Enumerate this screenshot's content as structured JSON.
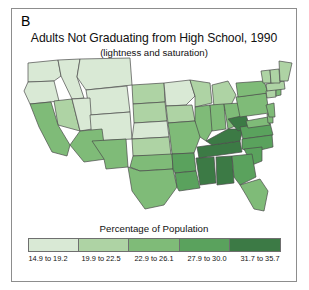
{
  "figure": {
    "panel_letter": "B",
    "title": "Adults Not Graduating from High School, 1990",
    "subtitle": "(lightness and saturation)"
  },
  "legend": {
    "title": "Percentage of Population",
    "classes": [
      {
        "label": "14.9 to 19.2",
        "color": "#d9e9d5",
        "min": 14.9,
        "max": 19.2
      },
      {
        "label": "19.9 to 22.5",
        "color": "#aed3a4",
        "min": 19.9,
        "max": 22.5
      },
      {
        "label": "22.9 to 26.1",
        "color": "#7fbb78",
        "min": 22.9,
        "max": 26.1
      },
      {
        "label": "27.9 to 30.0",
        "color": "#5aa25d",
        "min": 27.9,
        "max": 30.0
      },
      {
        "label": "31.7 to 35.7",
        "color": "#3c7a45",
        "min": 31.7,
        "max": 35.7
      }
    ]
  },
  "chart_data": {
    "type": "map",
    "title": "Adults Not Graduating from High School, 1990",
    "subtitle": "(lightness and saturation)",
    "legend_title": "Percentage of Population",
    "classification": "5-class sequential green ramp, lightness and saturation varying",
    "regions": [
      {
        "name": "Washington",
        "class": 1,
        "color": "#d9e9d5"
      },
      {
        "name": "Oregon",
        "class": 1,
        "color": "#d9e9d5"
      },
      {
        "name": "Idaho",
        "class": 1,
        "color": "#d9e9d5"
      },
      {
        "name": "Montana",
        "class": 1,
        "color": "#d9e9d5"
      },
      {
        "name": "Wyoming",
        "class": 1,
        "color": "#d9e9d5"
      },
      {
        "name": "North Dakota",
        "class": 2,
        "color": "#aed3a4"
      },
      {
        "name": "South Dakota",
        "class": 2,
        "color": "#aed3a4"
      },
      {
        "name": "Minnesota",
        "class": 1,
        "color": "#d9e9d5"
      },
      {
        "name": "Wisconsin",
        "class": 2,
        "color": "#aed3a4"
      },
      {
        "name": "Michigan",
        "class": 2,
        "color": "#aed3a4"
      },
      {
        "name": "Nevada",
        "class": 2,
        "color": "#aed3a4"
      },
      {
        "name": "Utah",
        "class": 1,
        "color": "#d9e9d5"
      },
      {
        "name": "Colorado",
        "class": 1,
        "color": "#d9e9d5"
      },
      {
        "name": "Nebraska",
        "class": 1,
        "color": "#d9e9d5"
      },
      {
        "name": "Iowa",
        "class": 2,
        "color": "#aed3a4"
      },
      {
        "name": "Illinois",
        "class": 3,
        "color": "#7fbb78"
      },
      {
        "name": "Indiana",
        "class": 3,
        "color": "#7fbb78"
      },
      {
        "name": "Ohio",
        "class": 3,
        "color": "#7fbb78"
      },
      {
        "name": "California",
        "class": 3,
        "color": "#7fbb78"
      },
      {
        "name": "Arizona",
        "class": 3,
        "color": "#7fbb78"
      },
      {
        "name": "New Mexico",
        "class": 3,
        "color": "#7fbb78"
      },
      {
        "name": "Kansas",
        "class": 2,
        "color": "#aed3a4"
      },
      {
        "name": "Missouri",
        "class": 3,
        "color": "#7fbb78"
      },
      {
        "name": "Oklahoma",
        "class": 3,
        "color": "#7fbb78"
      },
      {
        "name": "Texas",
        "class": 3,
        "color": "#7fbb78"
      },
      {
        "name": "Arkansas",
        "class": 4,
        "color": "#5aa25d"
      },
      {
        "name": "Louisiana",
        "class": 4,
        "color": "#5aa25d"
      },
      {
        "name": "Mississippi",
        "class": 5,
        "color": "#3c7a45"
      },
      {
        "name": "Alabama",
        "class": 5,
        "color": "#3c7a45"
      },
      {
        "name": "Tennessee",
        "class": 5,
        "color": "#3c7a45"
      },
      {
        "name": "Kentucky",
        "class": 5,
        "color": "#3c7a45"
      },
      {
        "name": "West Virginia",
        "class": 5,
        "color": "#3c7a45"
      },
      {
        "name": "Virginia",
        "class": 4,
        "color": "#5aa25d"
      },
      {
        "name": "North Carolina",
        "class": 4,
        "color": "#5aa25d"
      },
      {
        "name": "South Carolina",
        "class": 4,
        "color": "#5aa25d"
      },
      {
        "name": "Georgia",
        "class": 4,
        "color": "#5aa25d"
      },
      {
        "name": "Florida",
        "class": 3,
        "color": "#7fbb78"
      },
      {
        "name": "Pennsylvania",
        "class": 3,
        "color": "#7fbb78"
      },
      {
        "name": "New York",
        "class": 3,
        "color": "#7fbb78"
      },
      {
        "name": "Maryland",
        "class": 3,
        "color": "#7fbb78"
      },
      {
        "name": "Delaware",
        "class": 3,
        "color": "#7fbb78"
      },
      {
        "name": "New Jersey",
        "class": 3,
        "color": "#7fbb78"
      },
      {
        "name": "Connecticut",
        "class": 2,
        "color": "#aed3a4"
      },
      {
        "name": "Rhode Island",
        "class": 3,
        "color": "#7fbb78"
      },
      {
        "name": "Massachusetts",
        "class": 2,
        "color": "#aed3a4"
      },
      {
        "name": "Vermont",
        "class": 2,
        "color": "#aed3a4"
      },
      {
        "name": "New Hampshire",
        "class": 2,
        "color": "#aed3a4"
      },
      {
        "name": "Maine",
        "class": 2,
        "color": "#aed3a4"
      }
    ]
  }
}
